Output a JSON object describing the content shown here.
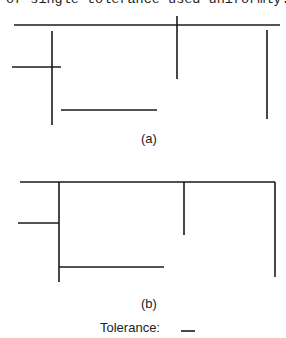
{
  "caption_top": "of single tolerance used uniformly.",
  "figure_a": {
    "label": "(a)",
    "segments": [
      {
        "x1": 14,
        "y1": 25,
        "x2": 280,
        "y2": 25
      },
      {
        "x1": 177,
        "y1": 16,
        "x2": 177,
        "y2": 79
      },
      {
        "x1": 52,
        "y1": 31,
        "x2": 52,
        "y2": 125
      },
      {
        "x1": 12,
        "y1": 67,
        "x2": 61,
        "y2": 67
      },
      {
        "x1": 61,
        "y1": 110,
        "x2": 157,
        "y2": 110
      },
      {
        "x1": 267,
        "y1": 30,
        "x2": 267,
        "y2": 119
      }
    ]
  },
  "figure_b": {
    "label": "(b)",
    "segments": [
      {
        "x1": 20,
        "y1": 182,
        "x2": 275,
        "y2": 182
      },
      {
        "x1": 59,
        "y1": 182,
        "x2": 59,
        "y2": 282
      },
      {
        "x1": 18,
        "y1": 223,
        "x2": 59,
        "y2": 223
      },
      {
        "x1": 59,
        "y1": 267,
        "x2": 164,
        "y2": 267
      },
      {
        "x1": 184,
        "y1": 182,
        "x2": 184,
        "y2": 235
      },
      {
        "x1": 275,
        "y1": 182,
        "x2": 275,
        "y2": 277
      }
    ]
  },
  "legend": {
    "label": "Tolerance:",
    "tolerance_segment": {
      "x1": 181,
      "y1": 331,
      "x2": 195,
      "y2": 331
    }
  },
  "colors": {
    "line": "#1a1a1a",
    "text": "#222222",
    "background": "#ffffff"
  }
}
